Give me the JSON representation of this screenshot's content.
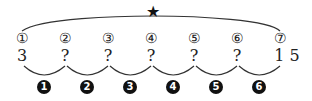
{
  "diagram": {
    "top_marker": "★",
    "positions": [
      "①",
      "②",
      "③",
      "④",
      "⑤",
      "⑥",
      "⑦"
    ],
    "values": [
      "3",
      "?",
      "?",
      "?",
      "?",
      "?",
      "1 5"
    ],
    "steps": [
      "1",
      "2",
      "3",
      "4",
      "5",
      "6"
    ]
  }
}
